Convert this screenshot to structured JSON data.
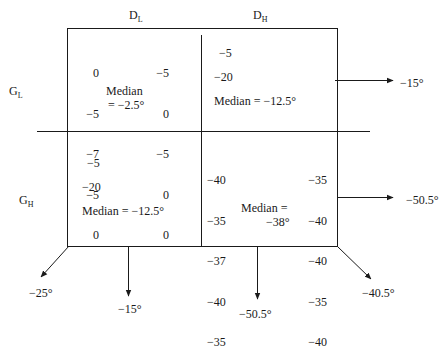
{
  "headers": {
    "col_low": {
      "main": "D",
      "sub": "L"
    },
    "col_high": {
      "main": "D",
      "sub": "H"
    },
    "row_low": {
      "main": "G",
      "sub": "L"
    },
    "row_high": {
      "main": "G",
      "sub": "H"
    }
  },
  "cells": {
    "gl_dl": {
      "left_values": [
        "0",
        "−5",
        "−7",
        "−5",
        "0"
      ],
      "right_values": [
        "−5",
        "0",
        "−5",
        "0",
        "0"
      ],
      "median_line1": "Median",
      "median_line2": "= −2.5°"
    },
    "gl_dh": {
      "values": [
        "−5",
        "−20"
      ],
      "median": "Median = −12.5°"
    },
    "gh_dl": {
      "values": [
        "−5",
        "−20"
      ],
      "median": "Median = −12.5°"
    },
    "gh_dh": {
      "left_values": [
        "−40",
        "−35",
        "−37",
        "−40",
        "−35"
      ],
      "right_values": [
        "−35",
        "−40",
        "−40",
        "−35",
        "−40"
      ],
      "median_line1": "Median =",
      "median_line2": "−38°"
    }
  },
  "arrows": {
    "row_low_effect": "−15°",
    "row_high_effect": "−50.5°",
    "col_low_effect": "−15°",
    "col_high_effect": "−50.5°",
    "diag_left": "−25°",
    "diag_right": "−40.5°"
  }
}
